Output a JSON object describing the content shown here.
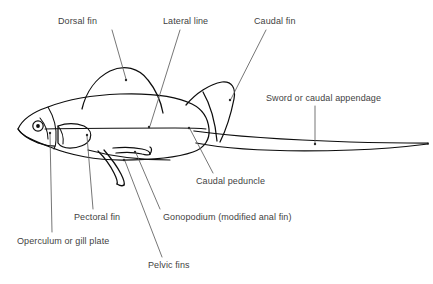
{
  "diagram": {
    "background_color": "#ffffff",
    "outline_color": "#0d0d0d",
    "label_color": "#3f3f3f",
    "leader_color": "#5d5d5d"
  },
  "labels": [
    {
      "id": "dorsal-fin",
      "text": "Dorsal fin",
      "x": 58,
      "y": 16,
      "leader": "M 112 30 L 126 79",
      "dot": {
        "x": 126,
        "y": 80
      }
    },
    {
      "id": "lateral-line",
      "text": "Lateral line",
      "x": 163,
      "y": 16,
      "leader": "M 180 30 L 150 126",
      "dot": {
        "x": 149,
        "y": 127
      }
    },
    {
      "id": "caudal-fin",
      "text": "Caudal fin",
      "x": 254,
      "y": 16,
      "leader": "M 266 30 L 231 99",
      "dot": {
        "x": 230,
        "y": 100
      }
    },
    {
      "id": "sword-or-caudal-appendage",
      "text": "Sword or caudal appendage",
      "x": 266,
      "y": 93,
      "leader": "M 315 106 L 315 143",
      "dot": {
        "x": 315,
        "y": 144
      }
    },
    {
      "id": "caudal-peduncle",
      "text": "Caudal peduncle",
      "x": 196,
      "y": 176,
      "leader": "M 213 173 L 190 129",
      "dot": {
        "x": 189,
        "y": 128
      }
    },
    {
      "id": "gonopodium",
      "text": "Gonopodium (modified anal fin)",
      "x": 163,
      "y": 212,
      "leader": "M 160 209 L 136 153",
      "dot": {
        "x": 135,
        "y": 152
      }
    },
    {
      "id": "pelvic-fins",
      "text": "Pelvic fins",
      "x": 148,
      "y": 260,
      "leader": "M 162 257 L 125 161",
      "dot": {
        "x": 124,
        "y": 160
      }
    },
    {
      "id": "pectoral-fin",
      "text": "Pectoral fin",
      "x": 74,
      "y": 212,
      "leader": "M 93 209 L 87 136",
      "dot": {
        "x": 87,
        "y": 135
      }
    },
    {
      "id": "operculum-or-gill-plate",
      "text": "Operculum or gill plate",
      "x": 17,
      "y": 236,
      "leader": "M 52 232 L 50 134",
      "dot": {
        "x": 50,
        "y": 133
      }
    }
  ],
  "shapes": {
    "body_outline": "M 18 129 C 22 120 33 112 48 107 C 66 100 92 95 120 94 C 150 93 176 96 192 104 C 202 109 208 118 209 129 C 210 139 205 148 193 152 C 176 158 150 160 122 160 C 96 160 70 155 50 147 C 34 141 22 136 18 129 Z",
    "head_snout": "M 18 129 C 21 134 28 139 38 143 C 44 145 50 146 55 146",
    "dorsal_fin": "M 82 109 C 86 92 96 78 110 71 C 124 64 139 68 148 80 C 156 90 161 102 163 113",
    "caudal_fin": "M 186 105 C 196 93 210 84 222 82 C 232 81 236 88 234 99 C 231 114 226 130 220 142",
    "caudal_fin_inner": "M 203 92 C 210 104 215 120 217 141",
    "sword_top": "M 194 131 C 230 136 290 140 350 142 C 385 143 410 143 428 143",
    "sword_bottom": "M 196 143 C 232 150 292 152 352 150 C 386 149 412 146 428 144",
    "sword_tip": "M 428 143 L 428 144",
    "lateral_line": "M 45 129 C 80 128 130 128 175 128 C 188 128 198 128 206 129",
    "operculum": "M 48 107 C 54 117 57 128 56 140 C 56 144 55 147 54 149",
    "gill_arc": "M 40 118 C 45 124 48 131 48 139",
    "pectoral_fin": "M 58 126 C 66 123 76 123 84 126 C 90 129 92 134 90 139 C 87 145 78 148 70 148 C 64 148 60 146 58 143 Z",
    "pectoral_fin_base": "M 58 126 C 62 131 64 137 63 144",
    "pelvic_fin_1": "M 98 151 C 104 157 110 165 114 173 C 117 179 118 182 117 184",
    "pelvic_fin_2": "M 104 150 C 110 157 117 166 121 174 C 124 180 125 183 124 185",
    "pelvic_fin_close": "M 117 184 C 120 186 123 186 124 185",
    "gonopodium_top": "M 113 148 C 122 147 133 147 142 149 C 147 150 150 152 150 154",
    "gonopodium_bottom": "M 116 153 C 124 152 134 152 142 154 C 147 155 149 156 150 154",
    "gonopodium_tip": "M 150 154 C 152 151 152 148 150 147",
    "belly_line": "M 88 150 C 110 156 140 160 170 160"
  }
}
